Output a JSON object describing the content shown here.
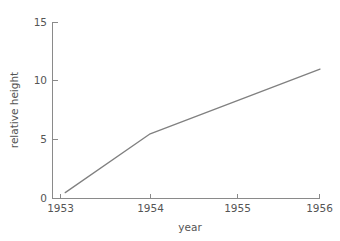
{
  "chart_data": {
    "type": "line",
    "title": "",
    "xlabel": "year",
    "ylabel": "relative height",
    "x": [
      1953,
      1954,
      1956
    ],
    "values": [
      0.5,
      5.5,
      11.0
    ],
    "series": [
      {
        "name": "relative height",
        "x": [
          1953,
          1954,
          1956
        ],
        "values": [
          0.5,
          5.5,
          11.0
        ]
      }
    ],
    "xlim": [
      1952.85,
      1956.0
    ],
    "ylim": [
      0,
      15
    ],
    "xticks": [
      1953,
      1954,
      1955,
      1956
    ],
    "xticklabels": [
      "1953",
      "1954",
      "1955",
      "1956"
    ],
    "yticks": [
      0,
      5,
      10,
      15
    ],
    "yticklabels": [
      "0",
      "5",
      "10",
      "15"
    ],
    "grid": false,
    "legend": false,
    "legend_position": "none",
    "line_color": "#808080",
    "axis_color": "#8a8a8a",
    "text_color": "#555555",
    "background_color": "#ffffff",
    "spines": [
      "left",
      "bottom"
    ]
  }
}
